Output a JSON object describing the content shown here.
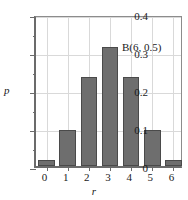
{
  "chart_data": {
    "type": "bar",
    "title": "",
    "subtitle": "",
    "xlabel": "r",
    "ylabel": "p",
    "categories": [
      "0",
      "1",
      "2",
      "3",
      "4",
      "5",
      "6"
    ],
    "values": [
      0.0156,
      0.0938,
      0.2344,
      0.3125,
      0.2344,
      0.0938,
      0.0156
    ],
    "series": [
      {
        "name": "B(6, 0.5)",
        "values": [
          0.0156,
          0.0938,
          0.2344,
          0.3125,
          0.2344,
          0.0938,
          0.0156
        ]
      }
    ],
    "annotations": [
      "B(6, 0.5)"
    ],
    "ylim": [
      0,
      0.4
    ],
    "xlim": [
      -0.5,
      6.5
    ],
    "ytick_labels": [
      "0",
      "0.1",
      "0.2",
      "0.3",
      "0.4"
    ],
    "ytick_values": [
      0,
      0.1,
      0.2,
      0.3,
      0.4
    ],
    "yminor_tick_values": [
      0.05,
      0.15,
      0.25,
      0.35
    ],
    "xtick_labels": [
      "0",
      "1",
      "2",
      "3",
      "4",
      "5",
      "6"
    ],
    "xtick_values": [
      0,
      1,
      2,
      3,
      4,
      5,
      6
    ],
    "grid": true,
    "legend": "none",
    "bar_color": "#6e6e6e",
    "bar_edge_color": "#4a4a4a",
    "grid_color": "#d9d9d9",
    "axis_color": "#6b6b6b"
  }
}
